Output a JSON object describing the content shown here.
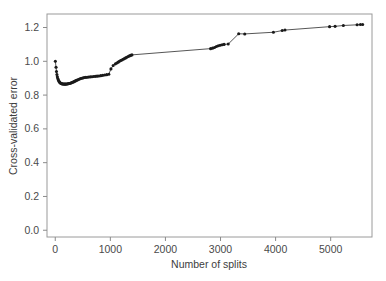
{
  "chart_data": {
    "type": "line",
    "title": "",
    "xlabel": "Number of splits",
    "ylabel": "Cross-validated error",
    "xlim": [
      -150,
      5750
    ],
    "ylim": [
      -0.04,
      1.28
    ],
    "xticks": [
      0,
      1000,
      2000,
      3000,
      4000,
      5000
    ],
    "xticklabels": [
      "0",
      "1000",
      "2000",
      "3000",
      "4000",
      "5000"
    ],
    "yticks": [
      0.0,
      0.2,
      0.4,
      0.6,
      0.8,
      1.0,
      1.2
    ],
    "yticklabels": [
      "0.0",
      "0.2",
      "0.4",
      "0.6",
      "0.8",
      "1.0",
      "1.2"
    ],
    "grid": false,
    "legend": null,
    "marker": "filled-circle",
    "line_color": "#2b2b2b",
    "marker_color": "#1a1a1a",
    "frame_color": "#9a9a9a",
    "background": "#ffffff",
    "series": [
      {
        "name": "cross-validated error",
        "x": [
          2,
          14,
          22,
          30,
          38,
          46,
          55,
          64,
          73,
          82,
          92,
          102,
          112,
          122,
          133,
          144,
          155,
          166,
          178,
          190,
          202,
          215,
          228,
          241,
          255,
          270,
          285,
          300,
          316,
          332,
          349,
          366,
          384,
          402,
          421,
          441,
          462,
          484,
          507,
          531,
          556,
          582,
          609,
          637,
          666,
          696,
          727,
          759,
          792,
          826,
          861,
          897,
          934,
          972,
          1011,
          1051,
          1092,
          1118,
          1142,
          1165,
          1188,
          1210,
          1232,
          1255,
          1278,
          1300,
          1322,
          1345,
          1368,
          1392,
          2820,
          2855,
          2890,
          2925,
          2960,
          2995,
          3030,
          3065,
          3140,
          3330,
          3440,
          3960,
          4120,
          4170,
          4980,
          5080,
          5230,
          5480,
          5540,
          5580
        ],
        "y": [
          1.0,
          0.965,
          0.94,
          0.922,
          0.908,
          0.898,
          0.89,
          0.884,
          0.879,
          0.875,
          0.872,
          0.87,
          0.868,
          0.867,
          0.866,
          0.866,
          0.866,
          0.865,
          0.865,
          0.865,
          0.866,
          0.866,
          0.867,
          0.868,
          0.869,
          0.87,
          0.872,
          0.874,
          0.876,
          0.878,
          0.881,
          0.884,
          0.887,
          0.889,
          0.892,
          0.895,
          0.898,
          0.9,
          0.902,
          0.904,
          0.905,
          0.906,
          0.907,
          0.908,
          0.909,
          0.91,
          0.911,
          0.912,
          0.913,
          0.915,
          0.917,
          0.919,
          0.921,
          0.923,
          0.955,
          0.975,
          0.985,
          0.99,
          0.995,
          1.0,
          1.005,
          1.008,
          1.012,
          1.016,
          1.02,
          1.024,
          1.028,
          1.032,
          1.035,
          1.038,
          1.075,
          1.078,
          1.082,
          1.088,
          1.092,
          1.095,
          1.098,
          1.1,
          1.102,
          1.163,
          1.162,
          1.172,
          1.182,
          1.185,
          1.205,
          1.207,
          1.212,
          1.216,
          1.218,
          1.218
        ],
        "point_count": 90
      }
    ]
  }
}
